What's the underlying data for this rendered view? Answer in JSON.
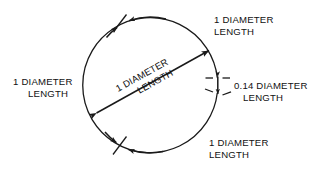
{
  "figure": {
    "type": "engineering-dimension-diagram",
    "background_color": "#ffffff",
    "line_color": "#1a1a1a",
    "text_color": "#111111",
    "shape": "circle-with-gap"
  },
  "labels": {
    "top_right": {
      "line1": "1 DIAMETER",
      "line2": "LENGTH"
    },
    "left": {
      "line1": "1 DIAMETER",
      "line2": "LENGTH"
    },
    "bottom_right": {
      "line1": "1 DIAMETER",
      "line2": "LENGTH"
    },
    "gap_dimension": {
      "line1": "0.14 DIAMETER",
      "line2": "LENGTH"
    },
    "diameter_arrow": {
      "line1": "1 DIAMETER",
      "line2": "LENGTH"
    }
  },
  "measurements": {
    "arc_segments": [
      {
        "name": "upper-right-arc",
        "value": "1 DIAMETER LENGTH"
      },
      {
        "name": "left-arc",
        "value": "1 DIAMETER LENGTH"
      },
      {
        "name": "lower-right-arc",
        "value": "1 DIAMETER LENGTH"
      },
      {
        "name": "right-gap",
        "value": "0.14 DIAMETER LENGTH"
      },
      {
        "name": "diagonal-chord",
        "value": "1 DIAMETER LENGTH"
      }
    ]
  }
}
